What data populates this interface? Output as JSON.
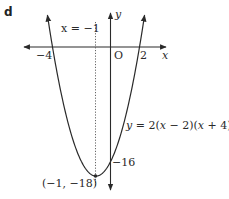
{
  "figure": {
    "part_label": "d",
    "equation": "y = 2(x − 2)(x + 4)",
    "axis_of_symmetry_label": "x = −1",
    "vertex_label": "(−1, −18)",
    "y_intercept_label": "−16",
    "origin_label": "O",
    "x_axis_label": "x",
    "y_axis_label": "y",
    "x_root_left_label": "−4",
    "x_root_right_label": "2"
  },
  "chart_data": {
    "type": "line",
    "title": "",
    "function": "y = 2(x-2)(x+4)",
    "xlabel": "x",
    "ylabel": "y",
    "roots": [
      -4,
      2
    ],
    "vertex": [
      -1,
      -18
    ],
    "y_intercept": -16,
    "axis_of_symmetry": "x = -1",
    "x": [
      -4.5,
      -4,
      -3,
      -2,
      -1,
      0,
      1,
      2,
      2.5
    ],
    "y": [
      6.5,
      0,
      -10,
      -16,
      -18,
      -16,
      -10,
      0,
      6.5
    ],
    "grid": false
  }
}
